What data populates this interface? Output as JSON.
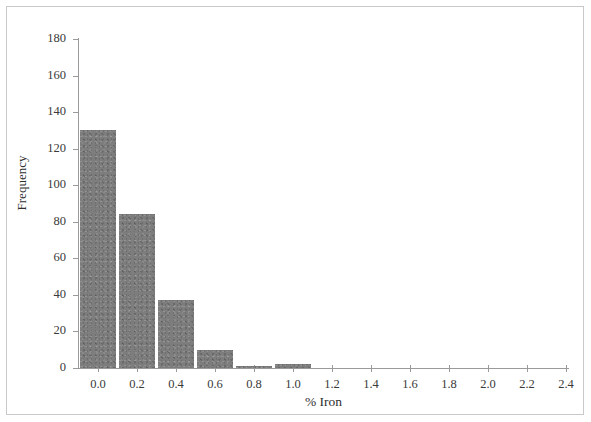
{
  "chart_data": {
    "type": "bar",
    "title": "",
    "xlabel": "% Iron",
    "ylabel": "Frequency",
    "categories": [
      "0.0",
      "0.2",
      "0.4",
      "0.6",
      "0.8",
      "1.0",
      "1.2",
      "1.4",
      "1.6",
      "1.8",
      "2.0",
      "2.2",
      "2.4"
    ],
    "values": [
      130,
      84,
      37,
      10,
      1,
      2,
      0,
      0,
      0,
      0,
      0,
      0,
      0
    ],
    "x": [
      0.0,
      0.2,
      0.4,
      0.6,
      0.8,
      1.0,
      1.2,
      1.4,
      1.6,
      1.8,
      2.0,
      2.2,
      2.4
    ],
    "xlim": [
      -0.1,
      2.5
    ],
    "ylim": [
      0,
      180
    ],
    "y_ticks": [
      0,
      20,
      40,
      60,
      80,
      100,
      120,
      140,
      160,
      180
    ],
    "y_tick_labels": [
      "0",
      "20",
      "40",
      "60",
      "80",
      "100",
      "120",
      "140",
      "160",
      "180"
    ],
    "x_ticks": [
      0.0,
      0.2,
      0.4,
      0.6,
      0.8,
      1.0,
      1.2,
      1.4,
      1.6,
      1.8,
      2.0,
      2.2,
      2.4
    ],
    "x_tick_labels": [
      "0.0",
      "0.2",
      "0.4",
      "0.6",
      "0.8",
      "1.0",
      "1.2",
      "1.4",
      "1.6",
      "1.8",
      "2.0",
      "2.2",
      "2.4"
    ],
    "grid": false,
    "legend": false,
    "bar_color": "#7d7d7d",
    "axis_color": "#9a9a9a",
    "frame_color": "#c9c9c9",
    "background": "#ffffff"
  }
}
